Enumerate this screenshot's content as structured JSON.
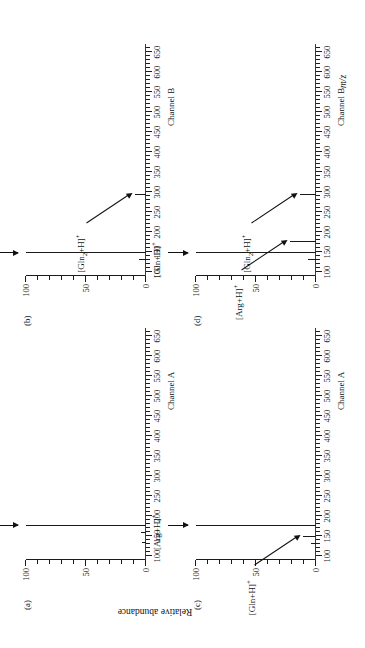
{
  "figure": {
    "y_axis_title": "Relative abundance",
    "x_axis_title": "m/z",
    "panels": [
      {
        "letter": "(a)",
        "channel": "Channel A",
        "annotations": [
          {
            "label_html": "[Arg+H]<sup>+</sup>",
            "label_text": "[Arg+H]+",
            "mz": 175
          }
        ]
      },
      {
        "letter": "(b)",
        "channel": "Channel B",
        "annotations": [
          {
            "label_html": "[Gln+H]<sup>+</sup>",
            "label_text": "[Gln+H]+",
            "mz": 147
          },
          {
            "label_html": "[Gln<sub>2</sub>+H]<sup>+</sup>",
            "label_text": "[Gln2+H]+",
            "mz": 293
          }
        ]
      },
      {
        "letter": "(c)",
        "channel": "Channel A",
        "annotations": [
          {
            "label_html": "[Arg+H]<sup>+</sup>",
            "label_text": "[Arg+H]+",
            "mz": 175
          },
          {
            "label_html": "[Gln+H]<sup>+</sup>",
            "label_text": "[Gln+H]+",
            "mz": 147
          }
        ]
      },
      {
        "letter": "(d)",
        "channel": "Channel B",
        "annotations": [
          {
            "label_html": "[Gln+H]<sup>+</sup>",
            "label_text": "[Gln+H]+",
            "mz": 147
          },
          {
            "label_html": "[Arg+H]<sup>+</sup>",
            "label_text": "[Arg+H]+",
            "mz": 175
          },
          {
            "label_html": "[Gln<sub>2</sub>+H]<sup>+</sup>",
            "label_text": "[Gln2+H]+",
            "mz": 293
          }
        ]
      }
    ]
  },
  "chart_data": [
    {
      "type": "line",
      "id": "panel-a",
      "title": "(a) Channel A",
      "xlabel": "m/z",
      "ylabel": "Relative abundance",
      "xlim": [
        90,
        670
      ],
      "ylim": [
        0,
        100
      ],
      "xticks": [
        100,
        150,
        200,
        250,
        300,
        350,
        400,
        450,
        500,
        550,
        600,
        650
      ],
      "xticklabels": [
        "100",
        "150",
        "200",
        "250",
        "300",
        "350",
        "400",
        "450",
        "500",
        "550",
        "600",
        "650"
      ],
      "yticks": [
        0,
        50,
        100
      ],
      "yticklabels": [
        "0",
        "50",
        "100"
      ],
      "grid": false,
      "legend": null,
      "peaks": [
        {
          "mz": 175,
          "intensity": 100,
          "label": "[Arg+H]+"
        },
        {
          "mz": 158,
          "intensity": 4,
          "label": ""
        },
        {
          "mz": 133,
          "intensity": 3,
          "label": ""
        }
      ]
    },
    {
      "type": "line",
      "id": "panel-b",
      "title": "(b) Channel B",
      "xlabel": "m/z",
      "ylabel": "Relative abundance",
      "xlim": [
        90,
        670
      ],
      "ylim": [
        0,
        100
      ],
      "xticks": [
        100,
        150,
        200,
        250,
        300,
        350,
        400,
        450,
        500,
        550,
        600,
        650
      ],
      "xticklabels": [
        "100",
        "150",
        "200",
        "250",
        "300",
        "350",
        "400",
        "450",
        "500",
        "550",
        "600",
        "650"
      ],
      "yticks": [
        0,
        50,
        100
      ],
      "yticklabels": [
        "0",
        "50",
        "100"
      ],
      "grid": false,
      "legend": null,
      "peaks": [
        {
          "mz": 147,
          "intensity": 100,
          "label": "[Gln+H]+"
        },
        {
          "mz": 130,
          "intensity": 6,
          "label": ""
        },
        {
          "mz": 293,
          "intensity": 9,
          "label": "[Gln2+H]+"
        }
      ]
    },
    {
      "type": "line",
      "id": "panel-c",
      "title": "(c) Channel A",
      "xlabel": "m/z",
      "ylabel": "Relative abundance",
      "xlim": [
        90,
        670
      ],
      "ylim": [
        0,
        100
      ],
      "xticks": [
        100,
        150,
        200,
        250,
        300,
        350,
        400,
        450,
        500,
        550,
        600,
        650
      ],
      "xticklabels": [
        "100",
        "150",
        "200",
        "250",
        "300",
        "350",
        "400",
        "450",
        "500",
        "550",
        "600",
        "650"
      ],
      "yticks": [
        0,
        50,
        100
      ],
      "yticklabels": [
        "0",
        "50",
        "100"
      ],
      "grid": false,
      "legend": null,
      "peaks": [
        {
          "mz": 175,
          "intensity": 100,
          "label": "[Arg+H]+"
        },
        {
          "mz": 147,
          "intensity": 11,
          "label": "[Gln+H]+"
        },
        {
          "mz": 130,
          "intensity": 4,
          "label": ""
        }
      ]
    },
    {
      "type": "line",
      "id": "panel-d",
      "title": "(d) Channel B",
      "xlabel": "m/z",
      "ylabel": "Relative abundance",
      "xlim": [
        90,
        670
      ],
      "ylim": [
        0,
        100
      ],
      "xticks": [
        100,
        150,
        200,
        250,
        300,
        350,
        400,
        450,
        500,
        550,
        600,
        650
      ],
      "xticklabels": [
        "100",
        "150",
        "200",
        "250",
        "300",
        "350",
        "400",
        "450",
        "500",
        "550",
        "600",
        "650"
      ],
      "yticks": [
        0,
        50,
        100
      ],
      "yticklabels": [
        "0",
        "50",
        "100"
      ],
      "grid": false,
      "legend": null,
      "peaks": [
        {
          "mz": 147,
          "intensity": 100,
          "label": "[Gln+H]+"
        },
        {
          "mz": 175,
          "intensity": 22,
          "label": "[Arg+H]+"
        },
        {
          "mz": 130,
          "intensity": 7,
          "label": ""
        },
        {
          "mz": 293,
          "intensity": 13,
          "label": "[Gln2+H]+"
        }
      ]
    }
  ]
}
